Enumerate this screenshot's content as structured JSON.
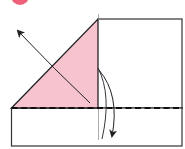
{
  "diagram": {
    "type": "origami-fold-step",
    "step_badge": {
      "color": "#f0607a",
      "label": ""
    },
    "colors": {
      "paper_colored": "#f6c3cf",
      "paper_white": "#ffffff",
      "outline": "#222222",
      "fold_line": "#111111"
    },
    "elements": [
      "step-number-badge",
      "upper-right-rectangle",
      "pink-triangle-flap",
      "lower-rectangle",
      "valley-fold-dashed-line",
      "vertical-crease-line",
      "unfold-arrow-up-left",
      "fold-arrow-down"
    ]
  }
}
